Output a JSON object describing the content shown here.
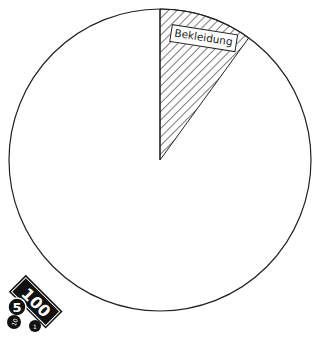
{
  "chart_data": {
    "type": "pie",
    "title": "",
    "slices": [
      {
        "label": "Bekleidung",
        "value": 10,
        "style": "hatched",
        "labeled": true
      },
      {
        "label": "",
        "value": 90,
        "style": "blank",
        "labeled": false
      }
    ],
    "start_angle_deg": 0,
    "direction": "clockwise",
    "colors": {
      "stroke": "#222222",
      "fill": "#ffffff",
      "hatch": "#333333"
    }
  },
  "labels": {
    "slice_label": "Bekleidung"
  },
  "icon": {
    "name": "money-icon",
    "banknote_value": "100",
    "coins": [
      "5",
      "10",
      "1"
    ]
  }
}
